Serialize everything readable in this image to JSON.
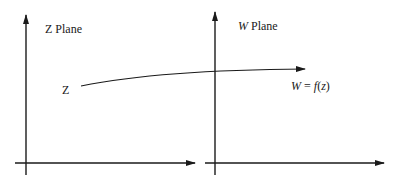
{
  "diagram": {
    "left_plane": {
      "title_var": "Z",
      "title_text": " Plane",
      "point_label": "Z"
    },
    "right_plane": {
      "title_var": "W",
      "title_text": " Plane"
    },
    "mapping": {
      "lhs": "W",
      "eq": " = ",
      "func": "f",
      "open": "(",
      "arg": "z",
      "close": ")"
    },
    "colors": {
      "stroke": "#1a1a1a",
      "background": "#ffffff"
    }
  }
}
